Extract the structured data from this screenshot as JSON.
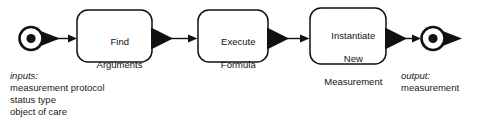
{
  "diagram": {
    "type": "uml-activity-diagram",
    "background_color": "#ffffff",
    "stroke_color": "#111111",
    "fill_color": "#ffffff",
    "start_node": {
      "name": "start-node",
      "shape": "filled-circle-in-ring-with-arrowhead"
    },
    "end_node": {
      "name": "end-node",
      "shape": "filled-circle-in-ring-with-arrowhead"
    },
    "activities": [
      {
        "id": "find-arguments",
        "label": "Find\nArguments",
        "line1": "Find",
        "line2": "Arguments",
        "line3": ""
      },
      {
        "id": "execute-formula",
        "label": "Execute\nFormula",
        "line1": "Execute",
        "line2": "Formula",
        "line3": ""
      },
      {
        "id": "instantiate-new-measurement",
        "label": "Instantiate\nNew\nMeasurement",
        "line1": "Instantiate",
        "line2": "New",
        "line3": "Measurement"
      }
    ],
    "transitions": [
      {
        "id": "t1",
        "from": "start-node",
        "to": "find-arguments"
      },
      {
        "id": "t2",
        "from": "find-arguments",
        "to": "execute-formula"
      },
      {
        "id": "t3",
        "from": "execute-formula",
        "to": "instantiate-new-measurement"
      },
      {
        "id": "t4",
        "from": "instantiate-new-measurement",
        "to": "end-node"
      }
    ],
    "inputs": {
      "title": "inputs:",
      "items": [
        "measurement protocol",
        "status type",
        "object of care"
      ]
    },
    "output": {
      "title": "output:",
      "items": [
        "measurement"
      ]
    }
  }
}
